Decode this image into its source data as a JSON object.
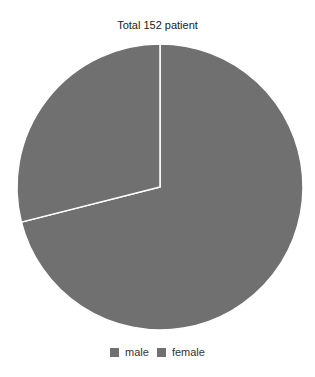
{
  "chart_data": {
    "type": "pie",
    "title": "Total 152 patient",
    "categories": [
      "male",
      "female"
    ],
    "values": [
      108,
      44
    ],
    "total": 152,
    "colors": [
      "#707070",
      "#707070"
    ],
    "slice_border_color": "#ffffff",
    "start_angle_deg": 0,
    "direction": "clockwise",
    "legend": {
      "position": "bottom",
      "entries": [
        "male",
        "female"
      ]
    }
  }
}
